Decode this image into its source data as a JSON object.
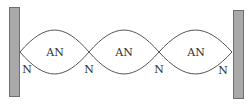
{
  "diagram": {
    "type": "standing-wave",
    "colors": {
      "background": "#ffffff",
      "wall_fill": "#a9a9a9",
      "wall_stroke": "#6e6e6e",
      "wave_stroke": "#555555",
      "text": "#333333"
    },
    "walls": [
      {
        "id": "left-wall",
        "x": 9,
        "y": 7,
        "width": 10,
        "height": 89
      },
      {
        "id": "right-wall",
        "x": 233,
        "y": 10,
        "width": 10,
        "height": 88
      }
    ],
    "wave": {
      "center_y": 52,
      "amplitude": 22,
      "node_x": [
        20,
        89,
        159,
        232
      ]
    },
    "antinode_labels": [
      {
        "text": "AN",
        "x": 55,
        "y": 56
      },
      {
        "text": "AN",
        "x": 124,
        "y": 56
      },
      {
        "text": "AN",
        "x": 196,
        "y": 56
      }
    ],
    "node_labels": [
      {
        "text": "N",
        "x": 27,
        "y": 73
      },
      {
        "text": "N",
        "x": 89,
        "y": 73
      },
      {
        "text": "N",
        "x": 159,
        "y": 73
      },
      {
        "text": "N",
        "x": 223,
        "y": 74
      }
    ]
  }
}
